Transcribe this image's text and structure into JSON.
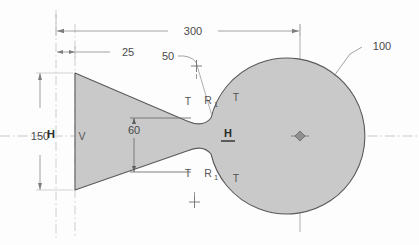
{
  "drawing": {
    "title": "Parametric sketch - tapered body with circular boss",
    "profile_fill": "#c9c9c9",
    "profile_stroke": "#5a5a5a",
    "dimension_color": "#6e6e6e",
    "text_color": "#4a4a4a",
    "centerline_color": "#a8a8a8",
    "background": "#fdfdfd"
  },
  "dimensions": [
    {
      "id": "overall-length",
      "label": "300",
      "type": "linear-horizontal"
    },
    {
      "id": "left-offset",
      "label": "25",
      "type": "linear-horizontal"
    },
    {
      "id": "left-height",
      "label": "150",
      "type": "linear-vertical"
    },
    {
      "id": "neck-height",
      "label": "60",
      "type": "linear-vertical"
    },
    {
      "id": "fillet-radius",
      "label": "50",
      "type": "radial"
    },
    {
      "id": "boss-diameter",
      "label": "100",
      "type": "radial"
    }
  ],
  "constraints": [
    {
      "id": "tangent-upper-left",
      "label": "T"
    },
    {
      "id": "tangent-upper-right",
      "label": "T"
    },
    {
      "id": "tangent-lower-left",
      "label": "T"
    },
    {
      "id": "tangent-lower-right",
      "label": "T"
    },
    {
      "id": "equal-upper",
      "label": "R",
      "subscript": "1"
    },
    {
      "id": "equal-lower",
      "label": "R",
      "subscript": "1"
    },
    {
      "id": "vertical-left-edge",
      "label": "V"
    },
    {
      "id": "horizontal-left",
      "label": "H"
    },
    {
      "id": "horizontal-center",
      "label": "H"
    }
  ]
}
